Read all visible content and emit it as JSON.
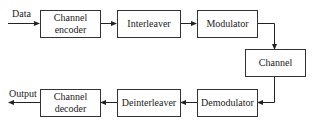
{
  "diagram": {
    "type": "block-diagram",
    "input_label": "Data",
    "output_label": "Output",
    "blocks": [
      {
        "id": "channel-encoder",
        "label": "Channel encoder"
      },
      {
        "id": "interleaver",
        "label": "Interleaver"
      },
      {
        "id": "modulator",
        "label": "Modulator"
      },
      {
        "id": "channel",
        "label": "Channel"
      },
      {
        "id": "demodulator",
        "label": "Demodulator"
      },
      {
        "id": "deinterleaver",
        "label": "Deinterleaver"
      },
      {
        "id": "channel-decoder",
        "label": "Channel decoder"
      }
    ],
    "edges": [
      [
        "Data",
        "channel-encoder"
      ],
      [
        "channel-encoder",
        "interleaver"
      ],
      [
        "interleaver",
        "modulator"
      ],
      [
        "modulator",
        "channel"
      ],
      [
        "channel",
        "demodulator"
      ],
      [
        "demodulator",
        "deinterleaver"
      ],
      [
        "deinterleaver",
        "channel-decoder"
      ],
      [
        "channel-decoder",
        "Output"
      ]
    ],
    "line_color": "#333333"
  }
}
